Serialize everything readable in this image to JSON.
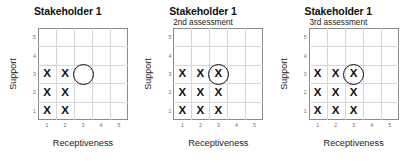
{
  "figure": {
    "xlabel": "Receptiveness",
    "ylabel": "Support",
    "xticks": [
      "1",
      "2",
      "3",
      "4",
      "5"
    ],
    "yticks": [
      "1",
      "2",
      "3",
      "4",
      "5"
    ]
  },
  "panels": [
    {
      "title": "Stakeholder 1",
      "subtitle": "",
      "marks": [
        {
          "x": 1,
          "y": 1,
          "glyph": "X"
        },
        {
          "x": 2,
          "y": 1,
          "glyph": "X"
        },
        {
          "x": 1,
          "y": 2,
          "glyph": "X"
        },
        {
          "x": 2,
          "y": 2,
          "glyph": "X"
        },
        {
          "x": 1,
          "y": 3,
          "glyph": "X"
        },
        {
          "x": 2,
          "y": 3,
          "glyph": "X"
        }
      ],
      "circle": {
        "x": 3,
        "y": 3
      }
    },
    {
      "title": "Stakeholder 1",
      "subtitle": "2nd assessment",
      "marks": [
        {
          "x": 1,
          "y": 1,
          "glyph": "X"
        },
        {
          "x": 2,
          "y": 1,
          "glyph": "X"
        },
        {
          "x": 3,
          "y": 1,
          "glyph": "X"
        },
        {
          "x": 1,
          "y": 2,
          "glyph": "X"
        },
        {
          "x": 2,
          "y": 2,
          "glyph": "X"
        },
        {
          "x": 3,
          "y": 2,
          "glyph": "X"
        },
        {
          "x": 1,
          "y": 3,
          "glyph": "X"
        },
        {
          "x": 2,
          "y": 3,
          "glyph": "X"
        },
        {
          "x": 3,
          "y": 3,
          "glyph": "X"
        }
      ],
      "circle": {
        "x": 3,
        "y": 3
      }
    },
    {
      "title": "Stakeholder 1",
      "subtitle": "3rd assessment",
      "marks": [
        {
          "x": 1,
          "y": 1,
          "glyph": "X"
        },
        {
          "x": 2,
          "y": 1,
          "glyph": "X"
        },
        {
          "x": 3,
          "y": 1,
          "glyph": "X"
        },
        {
          "x": 1,
          "y": 2,
          "glyph": "X"
        },
        {
          "x": 2,
          "y": 2,
          "glyph": "X"
        },
        {
          "x": 3,
          "y": 2,
          "glyph": "X"
        },
        {
          "x": 1,
          "y": 3,
          "glyph": "X"
        },
        {
          "x": 2,
          "y": 3,
          "glyph": "X"
        },
        {
          "x": 3,
          "y": 3,
          "glyph": "X"
        }
      ],
      "circle": {
        "x": 3,
        "y": 3
      }
    }
  ],
  "chart_data": {
    "type": "scatter",
    "title": "Stakeholder 1",
    "xlabel": "Receptiveness",
    "ylabel": "Support",
    "xlim": [
      0,
      5
    ],
    "ylim": [
      0,
      5
    ],
    "xticks": [
      1,
      2,
      3,
      4,
      5
    ],
    "yticks": [
      1,
      2,
      3,
      4,
      5
    ],
    "grid": true,
    "legend": "none",
    "panels": [
      {
        "title": "Stakeholder 1",
        "subtitle": "",
        "x_marks": [
          [
            1,
            1
          ],
          [
            2,
            1
          ],
          [
            1,
            2
          ],
          [
            2,
            2
          ],
          [
            1,
            3
          ],
          [
            2,
            3
          ]
        ],
        "circle_marker": [
          3,
          3
        ],
        "circle_contains_x": false
      },
      {
        "title": "Stakeholder 1",
        "subtitle": "2nd assessment",
        "x_marks": [
          [
            1,
            1
          ],
          [
            2,
            1
          ],
          [
            3,
            1
          ],
          [
            1,
            2
          ],
          [
            2,
            2
          ],
          [
            3,
            2
          ],
          [
            1,
            3
          ],
          [
            2,
            3
          ],
          [
            3,
            3
          ]
        ],
        "circle_marker": [
          3,
          3
        ],
        "circle_contains_x": true
      },
      {
        "title": "Stakeholder 1",
        "subtitle": "3rd assessment",
        "x_marks": [
          [
            1,
            1
          ],
          [
            2,
            1
          ],
          [
            3,
            1
          ],
          [
            1,
            2
          ],
          [
            2,
            2
          ],
          [
            3,
            2
          ],
          [
            1,
            3
          ],
          [
            2,
            3
          ],
          [
            3,
            3
          ]
        ],
        "circle_marker": [
          3,
          3
        ],
        "circle_contains_x": true
      }
    ]
  },
  "colors": {
    "plot_border": "#8a8a8a",
    "gridline": "#d6d6d6",
    "mark": "#111111",
    "background": "#ffffff"
  }
}
